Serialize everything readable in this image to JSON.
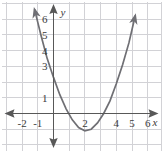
{
  "figure": {
    "name": "parabola-coordinate-graph",
    "background_color": "#ffffff",
    "grid_color": "#d2d2d6",
    "axis_color": "#585858",
    "curve_color": "#6f6f74",
    "label_color": "#3a3a3a",
    "border_color": "#d2d2d6"
  },
  "axes": {
    "x_axis_label": "x",
    "y_axis_label": "y",
    "x_tick_labels": [
      "-2",
      "-1",
      "2",
      "4",
      "5",
      "6"
    ],
    "y_tick_labels": [
      "1",
      "3",
      "4",
      "5",
      "6"
    ],
    "x_ticks_values": [
      -2,
      -1,
      2,
      4,
      5,
      6
    ],
    "y_ticks_values": [
      1,
      3,
      4,
      5,
      6
    ],
    "x_range": [
      -3,
      7
    ],
    "y_range": [
      -2.5,
      7.5
    ],
    "origin_px": [
      53.5,
      113.5
    ],
    "unit_px": 15.7
  },
  "chart_data": {
    "type": "line",
    "title": "",
    "subtitle": "",
    "xlabel": "x",
    "ylabel": "y",
    "xlim": [
      -3,
      7
    ],
    "ylim": [
      -2.5,
      7.5
    ],
    "grid": true,
    "legend": "none",
    "series": [
      {
        "name": "parabola",
        "shape": "upward parabola",
        "vertex": [
          2.1,
          -1.1
        ],
        "y_intercept": 1.2,
        "x_intercepts": [
          1.05,
          3.5
        ],
        "arrow_ends": [
          "up-left",
          "up-right"
        ],
        "x": [
          -1.2,
          -0.8,
          -0.4,
          0.0,
          0.4,
          0.8,
          1.2,
          1.6,
          2.0,
          2.4,
          2.8,
          3.2,
          3.6,
          4.0,
          4.4,
          4.8,
          5.2,
          5.6,
          6.0
        ],
        "y": [
          6.6,
          5.0,
          3.5,
          2.3,
          1.2,
          0.3,
          -0.4,
          -0.9,
          -1.1,
          -1.0,
          -0.6,
          0.0,
          0.8,
          1.9,
          3.1,
          4.5,
          6.2,
          8.1,
          10.2
        ]
      }
    ],
    "annotations": []
  }
}
